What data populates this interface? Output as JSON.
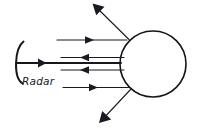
{
  "figure": {
    "background_color": "#ffffff",
    "line_color": "#1a1a22",
    "width": 201,
    "height": 136
  },
  "labels": {
    "radar": "Radar"
  },
  "elements": {
    "radar_dish": {
      "name": "radar-dish-arc",
      "description": "concave parabolic dish opening to the right"
    },
    "target": {
      "name": "target-sphere",
      "description": "large circle representing the target object",
      "center_x": 153,
      "center_y": 64,
      "radius": 33
    },
    "main_beam": {
      "name": "transmitted-beam",
      "direction": "right",
      "y": 63
    },
    "incident_rays": [
      {
        "name": "incident-ray-upper",
        "y": 40,
        "direction": "right"
      },
      {
        "name": "incident-ray-lower",
        "y": 87,
        "direction": "right"
      }
    ],
    "reflected_rays": [
      {
        "name": "backscatter-ray-upper",
        "y": 57,
        "direction": "left"
      },
      {
        "name": "backscatter-ray-lower",
        "y": 70,
        "direction": "left"
      }
    ],
    "scattered_rays": [
      {
        "name": "scattered-ray-up-left",
        "direction": "up-left"
      },
      {
        "name": "scattered-ray-down-left",
        "direction": "down-left"
      }
    ]
  }
}
